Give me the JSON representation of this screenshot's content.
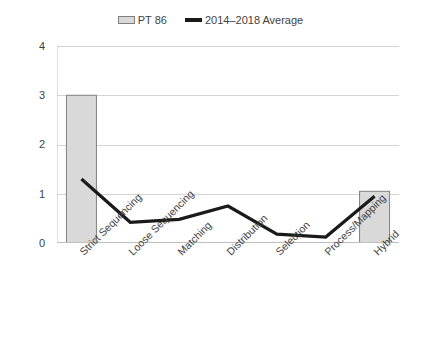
{
  "chart_data": {
    "type": "bar",
    "title": "",
    "subtitle": "",
    "xlabel": "",
    "ylabel": "",
    "ylim": [
      0,
      4
    ],
    "y_ticks": [
      0,
      1,
      2,
      3,
      4
    ],
    "grid": true,
    "legend_position": "top-center",
    "categories": [
      "Strict Sequencing",
      "Loose Sequencing",
      "Matching",
      "Distribution",
      "Selection",
      "Process/Mapping",
      "Hybrid"
    ],
    "series": [
      {
        "name": "PT 86",
        "type": "bar",
        "color": "#d9d9d9",
        "border_color": "#808080",
        "values": [
          3,
          0,
          0,
          0,
          0,
          0,
          1.05
        ]
      },
      {
        "name": "2014–2018 Average",
        "type": "line",
        "color": "#1a1a1a",
        "values": [
          1.3,
          0.42,
          0.48,
          0.75,
          0.18,
          0.12,
          0.95
        ]
      }
    ]
  },
  "legend": {
    "entries": [
      {
        "label": "PT 86",
        "swatch": "bar-swatch-icon"
      },
      {
        "label": "2014–2018 Average",
        "swatch": "line-swatch-icon"
      }
    ]
  },
  "axes": {
    "y_tick_labels": [
      "4",
      "3",
      "2",
      "1",
      "0"
    ],
    "x_tick_labels": [
      "Strict Sequencing",
      "Loose Sequencing",
      "Matching",
      "Distribution",
      "Selection",
      "Process/Mapping",
      "Hybrid"
    ]
  },
  "colors": {
    "bar_fill": "#d9d9d9",
    "bar_border": "#808080",
    "line": "#1a1a1a",
    "gridline": "#d4d4d4",
    "axis": "#bfbfbf",
    "text": "#3f3f3f",
    "background": "#ffffff"
  }
}
